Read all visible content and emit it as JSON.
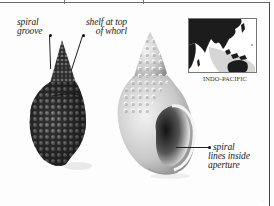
{
  "labels": {
    "spiral_groove": [
      "spiral",
      "groove"
    ],
    "shelf": [
      "shelf at top",
      "of whorl"
    ],
    "aperture": [
      "spiral",
      "lines inside",
      "aperture"
    ]
  },
  "map": {
    "caption": "INDO-PACIFIC",
    "land_color": "#1c1c1c",
    "shallow_color": "#d0d0d0"
  },
  "shells": {
    "dark_shell_color": "#3a3a3a",
    "light_shell_color": "#cfcfcf"
  },
  "page_marker": "·"
}
